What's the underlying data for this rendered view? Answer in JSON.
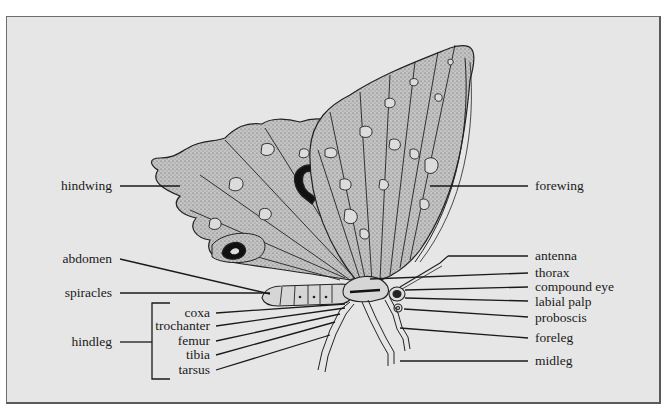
{
  "diagram": {
    "left_labels": {
      "hindwing": "hindwing",
      "abdomen": "abdomen",
      "spiracles": "spiracles",
      "hindleg": "hindleg"
    },
    "hindleg_parts": [
      "coxa",
      "trochanter",
      "femur",
      "tibia",
      "tarsus"
    ],
    "right_labels": {
      "forewing": "forewing",
      "antenna": "antenna",
      "thorax": "thorax",
      "compound_eye": "compound eye",
      "labial_palp": "labial palp",
      "proboscis": "proboscis",
      "foreleg": "foreleg",
      "midleg": "midleg"
    },
    "colors": {
      "background": "#e6e6e6",
      "ink": "#1a1a1a",
      "wing_fill": "#b9b9b9",
      "spot_fill": "#dcdcdc"
    }
  }
}
